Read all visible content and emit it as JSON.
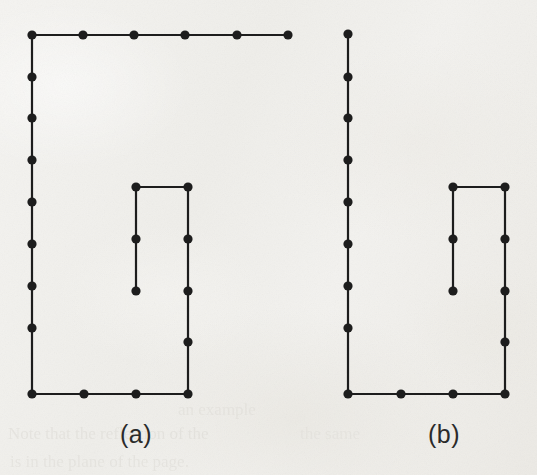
{
  "figure": {
    "kind": "two-panel-line-drawing",
    "background_color": "#f2f1ee",
    "ink_color": "#1d1d1d",
    "vertex_radius": 4.6,
    "edge_width": 2.2,
    "panels": [
      {
        "id": "panel-a",
        "label": "(a)",
        "label_x": 136,
        "label_y": 420,
        "vertices": [
          {
            "id": "a-t0",
            "x": 32,
            "y": 35
          },
          {
            "id": "a-t1",
            "x": 83,
            "y": 35
          },
          {
            "id": "a-t2",
            "x": 134,
            "y": 35
          },
          {
            "id": "a-t3",
            "x": 185,
            "y": 35
          },
          {
            "id": "a-t4",
            "x": 237,
            "y": 35
          },
          {
            "id": "a-t5",
            "x": 288,
            "y": 35
          },
          {
            "id": "a-l1",
            "x": 32,
            "y": 77
          },
          {
            "id": "a-l2",
            "x": 32,
            "y": 118
          },
          {
            "id": "a-l3",
            "x": 32,
            "y": 160
          },
          {
            "id": "a-l4",
            "x": 32,
            "y": 202
          },
          {
            "id": "a-l5",
            "x": 32,
            "y": 244
          },
          {
            "id": "a-l6",
            "x": 32,
            "y": 286
          },
          {
            "id": "a-l7",
            "x": 32,
            "y": 328
          },
          {
            "id": "a-b0",
            "x": 32,
            "y": 394
          },
          {
            "id": "a-b1",
            "x": 84,
            "y": 394
          },
          {
            "id": "a-b2",
            "x": 136,
            "y": 394
          },
          {
            "id": "a-b3",
            "x": 188,
            "y": 394
          },
          {
            "id": "a-i-tl",
            "x": 136,
            "y": 187
          },
          {
            "id": "a-i-tr",
            "x": 188,
            "y": 187
          },
          {
            "id": "a-i-l1",
            "x": 136,
            "y": 239
          },
          {
            "id": "a-i-l2",
            "x": 136,
            "y": 291
          },
          {
            "id": "a-i-r1",
            "x": 188,
            "y": 239
          },
          {
            "id": "a-i-r2",
            "x": 188,
            "y": 291
          },
          {
            "id": "a-i-r3",
            "x": 188,
            "y": 342
          }
        ],
        "edges": [
          [
            "a-t0",
            "a-t5"
          ],
          [
            "a-t0",
            "a-b0"
          ],
          [
            "a-b0",
            "a-b3"
          ],
          [
            "a-i-tl",
            "a-i-tr"
          ],
          [
            "a-i-tl",
            "a-i-l2"
          ],
          [
            "a-i-tr",
            "a-b3"
          ]
        ]
      },
      {
        "id": "panel-b",
        "label": "(b)",
        "label_x": 444,
        "label_y": 420,
        "vertices": [
          {
            "id": "b-l0",
            "x": 348,
            "y": 34
          },
          {
            "id": "b-l1",
            "x": 348,
            "y": 77
          },
          {
            "id": "b-l2",
            "x": 348,
            "y": 118
          },
          {
            "id": "b-l3",
            "x": 348,
            "y": 160
          },
          {
            "id": "b-l4",
            "x": 348,
            "y": 202
          },
          {
            "id": "b-l5",
            "x": 348,
            "y": 244
          },
          {
            "id": "b-l6",
            "x": 348,
            "y": 286
          },
          {
            "id": "b-l7",
            "x": 348,
            "y": 328
          },
          {
            "id": "b-b0",
            "x": 348,
            "y": 394
          },
          {
            "id": "b-b1",
            "x": 401,
            "y": 394
          },
          {
            "id": "b-b2",
            "x": 453,
            "y": 394
          },
          {
            "id": "b-b3",
            "x": 505,
            "y": 394
          },
          {
            "id": "b-i-tl",
            "x": 453,
            "y": 187
          },
          {
            "id": "b-i-tr",
            "x": 505,
            "y": 187
          },
          {
            "id": "b-i-l1",
            "x": 453,
            "y": 239
          },
          {
            "id": "b-i-l2",
            "x": 453,
            "y": 291
          },
          {
            "id": "b-i-r1",
            "x": 505,
            "y": 239
          },
          {
            "id": "b-i-r2",
            "x": 505,
            "y": 291
          },
          {
            "id": "b-i-r3",
            "x": 505,
            "y": 342
          }
        ],
        "edges": [
          [
            "b-l0",
            "b-b0"
          ],
          [
            "b-b0",
            "b-b3"
          ],
          [
            "b-i-tl",
            "b-i-tr"
          ],
          [
            "b-i-tl",
            "b-i-l2"
          ],
          [
            "b-i-tr",
            "b-b3"
          ]
        ]
      }
    ]
  },
  "background_text": {
    "note": "faint show-through from the reverse side of the scanned page",
    "lines": [
      {
        "text": "an example",
        "x": 178,
        "y": 400,
        "size": 17,
        "opacity": 0.22
      },
      {
        "text": "Note that the reflection of the",
        "x": 8,
        "y": 424,
        "size": 17,
        "opacity": 0.26
      },
      {
        "text": "is in the plane of the page.",
        "x": 10,
        "y": 452,
        "size": 17,
        "opacity": 0.24
      },
      {
        "text": "the same",
        "x": 300,
        "y": 424,
        "size": 17,
        "opacity": 0.18
      }
    ]
  }
}
